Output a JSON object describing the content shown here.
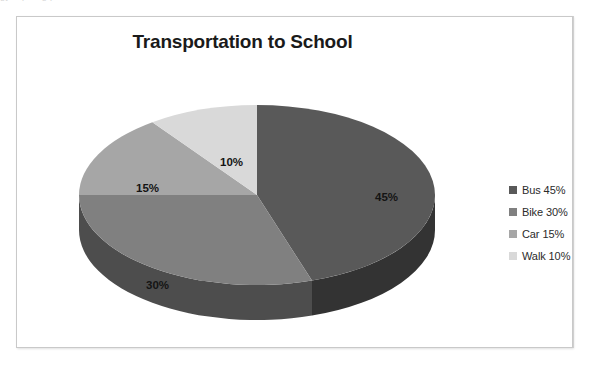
{
  "page": {
    "background_color": "#ffffff",
    "top_scan_artifact_text": "gy   ..  p  ....g  p ...  ..."
  },
  "chart_frame": {
    "border_color": "#c9c9c9",
    "background_color": "#ffffff"
  },
  "chart_data": {
    "type": "pie",
    "title": "Transportation to School",
    "xlabel": "",
    "ylabel": "",
    "categories": [
      "Bus",
      "Bike",
      "Car",
      "Walk"
    ],
    "values": [
      45,
      30,
      15,
      10
    ],
    "value_unit": "%",
    "slice_labels": [
      "45%",
      "30%",
      "15%",
      "10%"
    ],
    "legend_entries": [
      "Bus 45%",
      "Bike 30%",
      "Car 15%",
      "Walk 10%"
    ],
    "legend_position": "right",
    "colors": [
      "#595959",
      "#808080",
      "#a6a6a6",
      "#d9d9d9"
    ],
    "side_colors": [
      "#333333",
      "#4d4d4d",
      "#6e6e6e",
      "#9a9a9a"
    ],
    "three_d": true,
    "start_angle_clock": 12,
    "direction": "clockwise",
    "grid": false
  },
  "legend": {
    "items": [
      {
        "label": "Bus 45%",
        "color": "#595959"
      },
      {
        "label": "Bike 30%",
        "color": "#808080"
      },
      {
        "label": "Car 15%",
        "color": "#a6a6a6"
      },
      {
        "label": "Walk 10%",
        "color": "#d9d9d9"
      }
    ]
  }
}
